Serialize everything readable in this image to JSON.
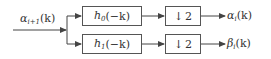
{
  "diagram": {
    "type": "analysis filter bank (one stage)",
    "input": {
      "symbol": "α",
      "subscript": "i+1",
      "arg": "(k)"
    },
    "branches": [
      {
        "filter": {
          "symbol": "h",
          "subscript": "0",
          "arg": "(−k)"
        },
        "decimator": {
          "arrow": "↓",
          "factor": "2"
        },
        "output": {
          "symbol": "α",
          "subscript": "i",
          "arg": "(k)"
        }
      },
      {
        "filter": {
          "symbol": "h",
          "subscript": "1",
          "arg": "(−k)"
        },
        "decimator": {
          "arrow": "↓",
          "factor": "2"
        },
        "output": {
          "symbol": "β",
          "subscript": "i",
          "arg": "(k)"
        }
      }
    ],
    "colors": {
      "line": "#444444",
      "text": "#333333",
      "background": "#ffffff"
    }
  }
}
